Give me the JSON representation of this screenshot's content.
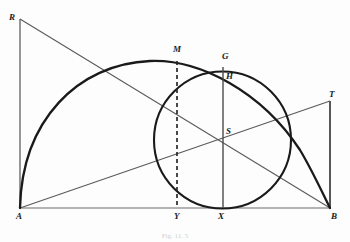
{
  "figure": {
    "caption": "Fig. 11. 5",
    "background_color": "#fdfdfd",
    "stroke_color": "#1a1a1a",
    "thin_stroke_color": "#555555",
    "labels": {
      "R": "R",
      "M": "M",
      "G": "G",
      "H": "H",
      "T": "T",
      "S": "S",
      "A": "A",
      "Y": "Y",
      "X": "X",
      "B": "B"
    }
  },
  "geometry": {
    "points": {
      "A": {
        "x": 20,
        "y": 208,
        "label": "A"
      },
      "B": {
        "x": 330,
        "y": 208,
        "label": "B"
      },
      "R": {
        "x": 20,
        "y": 19,
        "label": "R"
      },
      "T": {
        "x": 330,
        "y": 101,
        "label": "T"
      },
      "S": {
        "x": 222,
        "y": 139,
        "label": "S"
      },
      "M": {
        "x": 177,
        "y": 62,
        "label": "M"
      },
      "G": {
        "x": 223,
        "y": 68,
        "label": "G"
      },
      "H": {
        "x": 223,
        "y": 72,
        "label": "H"
      },
      "X": {
        "x": 222,
        "y": 208,
        "label": "X"
      },
      "Y": {
        "x": 177,
        "y": 208,
        "label": "Y"
      }
    },
    "circle": {
      "cx": 222.5,
      "cy": 140,
      "r": 68.5,
      "stroke_width": 2
    },
    "big_arc": {
      "start": {
        "x": 20,
        "y": 208
      },
      "end": {
        "x": 330,
        "y": 208
      },
      "apex": {
        "x": 180,
        "y": 62
      },
      "stroke_width": 2.2
    },
    "lines": [
      {
        "name": "baseline-AB",
        "x1": 20,
        "y1": 208,
        "x2": 330,
        "y2": 208,
        "width": 1
      },
      {
        "name": "vertical-AR",
        "x1": 20,
        "y1": 208,
        "x2": 20,
        "y2": 19,
        "width": 1.2
      },
      {
        "name": "vertical-BT",
        "x1": 330,
        "y1": 208,
        "x2": 330,
        "y2": 101,
        "width": 1.4
      },
      {
        "name": "diagonal-RB",
        "x1": 20,
        "y1": 19,
        "x2": 330,
        "y2": 208,
        "width": 1
      },
      {
        "name": "diagonal-AT",
        "x1": 20,
        "y1": 208,
        "x2": 330,
        "y2": 101,
        "width": 1
      },
      {
        "name": "vertical-GX",
        "x1": 223,
        "y1": 68,
        "x2": 223,
        "y2": 208,
        "width": 1.2
      }
    ],
    "dashed_line": {
      "name": "dashed-MY",
      "x1": 177,
      "y1": 62,
      "x2": 177,
      "y2": 208,
      "width": 1.6,
      "dash": "4 3"
    }
  },
  "label_positions": {
    "R": {
      "x": 9,
      "y": 13
    },
    "M": {
      "x": 173,
      "y": 45
    },
    "G": {
      "x": 220,
      "y": 52
    },
    "H": {
      "x": 225,
      "y": 71
    },
    "T": {
      "x": 329,
      "y": 90
    },
    "S": {
      "x": 225,
      "y": 126
    },
    "A": {
      "x": 16,
      "y": 212
    },
    "Y": {
      "x": 174,
      "y": 212
    },
    "X": {
      "x": 218,
      "y": 212
    },
    "B": {
      "x": 331,
      "y": 212
    },
    "caption": {
      "y": 231
    }
  }
}
